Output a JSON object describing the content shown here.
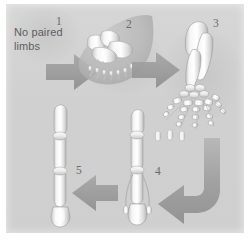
{
  "figure": {
    "caption": "No paired\nlimbs",
    "background_color": "#d2d2d2",
    "mat_color": "#ffffff",
    "arrow_color": "#9a9a9a",
    "bone_color": "#f2f2f2",
    "label_color": "#6a6a6a",
    "stages": [
      {
        "number": "1",
        "name": "no-paired-limbs-stage",
        "label": "1"
      },
      {
        "number": "2",
        "name": "paddle-fin-stage",
        "label": "2"
      },
      {
        "number": "3",
        "name": "five-digit-limb-stage",
        "label": "3"
      },
      {
        "number": "4",
        "name": "reduced-digit-limb-stage",
        "label": "4"
      },
      {
        "number": "5",
        "name": "single-digit-hoof-stage",
        "label": "5"
      }
    ],
    "arrows": [
      {
        "name": "arrow-1-to-2",
        "direction": "right"
      },
      {
        "name": "arrow-2-to-3",
        "direction": "right"
      },
      {
        "name": "arrow-3-to-4",
        "direction": "curve-down-left"
      },
      {
        "name": "arrow-4-to-5",
        "direction": "left"
      }
    ]
  }
}
